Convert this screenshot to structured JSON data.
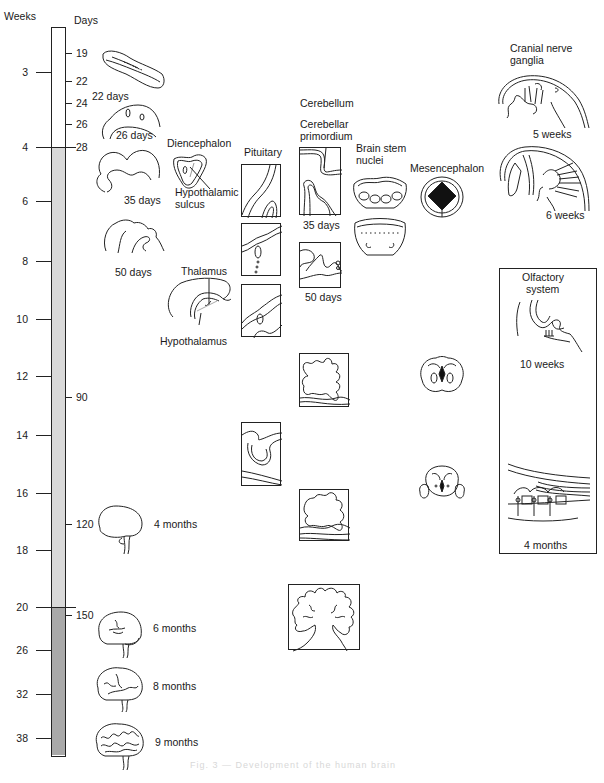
{
  "scale": {
    "weeks_header": "Weeks",
    "days_header": "Days",
    "weeks": [
      {
        "label": "3",
        "y": 72
      },
      {
        "label": "4",
        "y": 147
      },
      {
        "label": "6",
        "y": 201
      },
      {
        "label": "8",
        "y": 261
      },
      {
        "label": "10",
        "y": 319
      },
      {
        "label": "12",
        "y": 376
      },
      {
        "label": "14",
        "y": 435
      },
      {
        "label": "16",
        "y": 493
      },
      {
        "label": "18",
        "y": 550
      },
      {
        "label": "20",
        "y": 607
      },
      {
        "label": "26",
        "y": 650
      },
      {
        "label": "32",
        "y": 694
      },
      {
        "label": "38",
        "y": 738
      }
    ],
    "days": [
      {
        "label": "19",
        "y": 53
      },
      {
        "label": "22",
        "y": 81
      },
      {
        "label": "24",
        "y": 103
      },
      {
        "label": "26",
        "y": 124
      },
      {
        "label": "28",
        "y": 147
      },
      {
        "label": "90",
        "y": 397
      },
      {
        "label": "120",
        "y": 524
      },
      {
        "label": "150",
        "y": 615
      }
    ],
    "segments": [
      {
        "name": "embryonic",
        "from_y": 0,
        "to_y": 147,
        "color": "#ffffff"
      },
      {
        "name": "early-fetal",
        "from_y": 147,
        "to_y": 607,
        "color": "#d9d9d9"
      },
      {
        "name": "late-fetal",
        "from_y": 607,
        "to_y": 757,
        "color": "#a9a9a9"
      }
    ]
  },
  "whole_brain": {
    "stages": [
      {
        "label": "22 days"
      },
      {
        "label": "26 days"
      },
      {
        "label": "35 days"
      },
      {
        "label": "50 days"
      },
      {
        "label": "4 months"
      },
      {
        "label": "6 months"
      },
      {
        "label": "8 months"
      },
      {
        "label": "9 months"
      }
    ]
  },
  "columns": {
    "diencephalon": {
      "title": "Diencephalon",
      "labels": [
        "Hypothalamic",
        "sulcus",
        "Thalamus",
        "Hypothalamus"
      ]
    },
    "pituitary": {
      "title": "Pituitary"
    },
    "cerebellum": {
      "title": "Cerebellum",
      "sublabel_1": "Cerebellar",
      "sublabel_2": "primordium",
      "stages": [
        "35 days",
        "50 days"
      ]
    },
    "brain_stem": {
      "title_1": "Brain stem",
      "title_2": "nuclei"
    },
    "mesencephalon": {
      "title": "Mesencephalon"
    },
    "cranial_nerve": {
      "title_1": "Cranial nerve",
      "title_2": "ganglia",
      "stages": [
        "5 weeks",
        "6 weeks"
      ]
    },
    "olfactory": {
      "title_1": "Olfactory",
      "title_2": "system",
      "stages": [
        "10 weeks",
        "4 months"
      ]
    }
  },
  "caption": "Fig. 3 — Development of the human brain"
}
